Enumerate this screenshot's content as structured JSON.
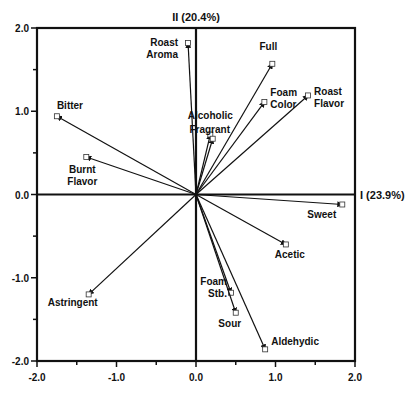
{
  "chart_data": {
    "type": "scatter",
    "subtype": "pca-biplot",
    "title": "",
    "xlabel": "I (23.9%)",
    "ylabel": "II (20.4%)",
    "xlim": [
      -2.0,
      2.0
    ],
    "ylim": [
      -2.0,
      2.0
    ],
    "x_ticks": [
      "-2.0",
      "-1.0",
      "0.0",
      "1.0",
      "2.0"
    ],
    "y_ticks": [
      "2.0",
      "1.0",
      "0.0",
      "-1.0",
      "-2.0"
    ],
    "grid": false,
    "legend": null,
    "points": [
      {
        "name": "Roast Aroma",
        "label_lines": [
          "Roast",
          "Aroma"
        ],
        "x": -0.1,
        "y": 1.82
      },
      {
        "name": "Full",
        "label_lines": [
          "Full"
        ],
        "x": 0.96,
        "y": 1.57
      },
      {
        "name": "Foam Color",
        "label_lines": [
          "Foam",
          "Color"
        ],
        "x": 0.86,
        "y": 1.11
      },
      {
        "name": "Roast Flavor",
        "label_lines": [
          "Roast",
          "Flavor"
        ],
        "x": 1.41,
        "y": 1.19
      },
      {
        "name": "Alcoholic",
        "label_lines": [
          "Alcoholic"
        ],
        "x": 0.18,
        "y": 0.72
      },
      {
        "name": "Fragrant",
        "label_lines": [
          "Fragrant"
        ],
        "x": 0.21,
        "y": 0.67
      },
      {
        "name": "Bitter",
        "label_lines": [
          "Bitter"
        ],
        "x": -1.75,
        "y": 0.94
      },
      {
        "name": "Burnt Flavor",
        "label_lines": [
          "Burnt",
          "Flavor"
        ],
        "x": -1.38,
        "y": 0.45
      },
      {
        "name": "Sweet",
        "label_lines": [
          "Sweet"
        ],
        "x": 1.84,
        "y": -0.12
      },
      {
        "name": "Acetic",
        "label_lines": [
          "Acetic"
        ],
        "x": 1.13,
        "y": -0.6
      },
      {
        "name": "Astringent",
        "label_lines": [
          "Astringent"
        ],
        "x": -1.35,
        "y": -1.2
      },
      {
        "name": "Foam Stb.",
        "label_lines": [
          "Foam",
          "Stb."
        ],
        "x": 0.44,
        "y": -1.18
      },
      {
        "name": "Sour",
        "label_lines": [
          "Sour"
        ],
        "x": 0.5,
        "y": -1.42
      },
      {
        "name": "Aldehydic",
        "label_lines": [
          "Aldehydic"
        ],
        "x": 0.87,
        "y": -1.86
      }
    ]
  },
  "layout": {
    "plot": {
      "left": 37,
      "top": 28,
      "right": 355,
      "bottom": 361
    },
    "labels": {
      "Roast Aroma": {
        "dx": -10,
        "dy": 3,
        "anchor": "end"
      },
      "Full": {
        "dx": -4,
        "dy": -14,
        "anchor": "middle"
      },
      "Foam Color": {
        "dx": 6,
        "dy": -6,
        "anchor": "start"
      },
      "Roast Flavor": {
        "dx": 6,
        "dy": 0,
        "anchor": "start"
      },
      "Alcoholic": {
        "dx": 0,
        "dy": -16,
        "anchor": "middle"
      },
      "Fragrant": {
        "dx": -3,
        "dy": -6,
        "anchor": "middle"
      },
      "Bitter": {
        "dx": 0,
        "dy": -7,
        "anchor": "start"
      },
      "Burnt Flavor": {
        "dx": -4,
        "dy": 16,
        "anchor": "middle"
      },
      "Sweet": {
        "dx": -6,
        "dy": 14,
        "anchor": "end"
      },
      "Acetic": {
        "dx": 4,
        "dy": 14,
        "anchor": "middle"
      },
      "Astringent": {
        "dx": -16,
        "dy": 12,
        "anchor": "middle"
      },
      "Foam Stb.": {
        "dx": -4,
        "dy": -8,
        "anchor": "end"
      },
      "Sour": {
        "dx": -6,
        "dy": 14,
        "anchor": "middle"
      },
      "Aldehydic": {
        "dx": 6,
        "dy": -4,
        "anchor": "start"
      }
    }
  }
}
